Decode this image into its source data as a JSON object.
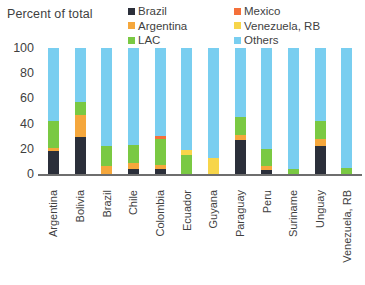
{
  "chart_data": {
    "type": "bar",
    "subtype": "stacked-column-100",
    "title": "",
    "ylabel": "Percent of total",
    "xlabel": "",
    "ylim": [
      0,
      100
    ],
    "yticks": [
      "100",
      "80",
      "60",
      "40",
      "20",
      "0"
    ],
    "grid": false,
    "legend_position": "top",
    "categories": [
      "Argentina",
      "Bolivia",
      "Brazil",
      "Chile",
      "Colombia",
      "Ecuador",
      "Guyana",
      "Paraguay",
      "Peru",
      "Suriname",
      "Unguay",
      "Venezuela, RB"
    ],
    "series": [
      {
        "name": "Brazil",
        "color": "#2b2f3a",
        "values": [
          18,
          29,
          0,
          4,
          4,
          0,
          0,
          27,
          3,
          0,
          22,
          0
        ]
      },
      {
        "name": "Argentina",
        "color": "#f5a73c",
        "values": [
          3,
          18,
          6,
          5,
          3,
          0,
          0,
          4,
          3,
          0,
          6,
          0
        ]
      },
      {
        "name": "LAC",
        "color": "#7ac943",
        "values": [
          21,
          10,
          16,
          14,
          21,
          15,
          0,
          14,
          14,
          4,
          14,
          5
        ]
      },
      {
        "name": "Mexico",
        "color": "#f4703a",
        "values": [
          0,
          0,
          0,
          0,
          2,
          0,
          0,
          0,
          0,
          0,
          0,
          0
        ]
      },
      {
        "name": "Venezuela, RB",
        "color": "#f7d54a",
        "values": [
          0,
          0,
          0,
          0,
          0,
          4,
          13,
          0,
          0,
          0,
          0,
          0
        ]
      },
      {
        "name": "Others",
        "color": "#79cef0",
        "values": [
          58,
          43,
          78,
          77,
          70,
          81,
          87,
          55,
          80,
          96,
          58,
          95
        ]
      }
    ]
  },
  "chart": {
    "axis_title": "Percent of total"
  },
  "legend": {
    "items": [
      {
        "label": "Brazil",
        "color": "#2b2f3a"
      },
      {
        "label": "Mexico",
        "color": "#f4703a"
      },
      {
        "label": "Argentina",
        "color": "#f5a73c"
      },
      {
        "label": "Venezuela, RB",
        "color": "#f7d54a"
      },
      {
        "label": "LAC",
        "color": "#7ac943"
      },
      {
        "label": "Others",
        "color": "#79cef0"
      }
    ]
  }
}
